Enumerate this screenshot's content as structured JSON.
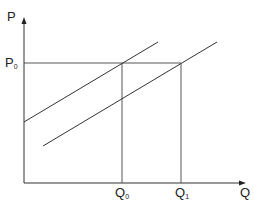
{
  "diagram": {
    "type": "supply-shift",
    "axes": {
      "y_label": "P",
      "x_label": "Q"
    },
    "price_level": {
      "label": "P",
      "subscript": "0"
    },
    "quantities": [
      {
        "label": "Q",
        "subscript": "0"
      },
      {
        "label": "Q",
        "subscript": "1"
      }
    ],
    "curves": [
      {
        "name": "supply-curve-original"
      },
      {
        "name": "supply-curve-shifted-right"
      }
    ],
    "colors": {
      "line": "#333333",
      "background": "#ffffff"
    }
  }
}
